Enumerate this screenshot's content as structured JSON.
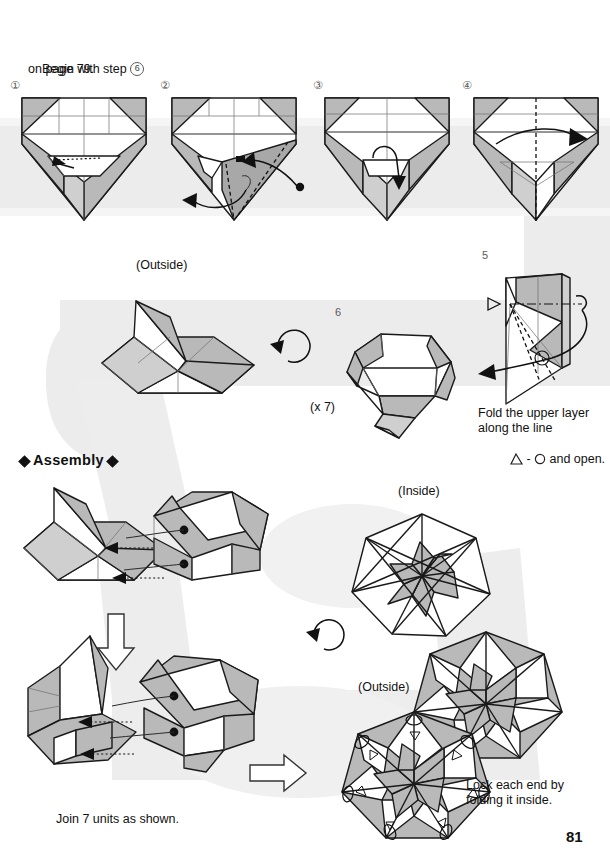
{
  "page": {
    "number": "81",
    "title_partial": "",
    "background_color": "#ffffff",
    "guide_band_color": "#ebebeb",
    "paper_gray": "#b9b9b9",
    "line_color": "#1a1a1a"
  },
  "intro": {
    "line1_pre": "Begin with step ",
    "line1_circled": "6",
    "line2": "on page 79."
  },
  "row1": {
    "steps": [
      {
        "num": "1",
        "num_display": "①"
      },
      {
        "num": "2",
        "num_display": "②"
      },
      {
        "num": "3",
        "num_display": "③"
      },
      {
        "num": "4",
        "num_display": "④"
      }
    ]
  },
  "row2": {
    "outside_label": "(Outside)",
    "step6_num": "6",
    "repeat_label": "(x 7)",
    "step5_num": "5",
    "step5_caption": {
      "line1": "Fold the upper layer",
      "line2": "along the line",
      "line3_pre": "",
      "line3_mid": " - ",
      "line3_post": " and open.",
      "symbol_left": "triangle-outline",
      "symbol_right": "circle-outline"
    }
  },
  "assembly": {
    "heading": "Assembly",
    "heading_ornament": "◆",
    "join_caption": "Join 7 units as shown.",
    "inside_label": "(Inside)",
    "outside_label": "(Outside)",
    "lock_caption": {
      "line1": "Lock each end by",
      "line2": "folding it inside."
    }
  },
  "icons": {
    "down_arrow": "down-block-arrow",
    "right_arrow": "right-block-arrow",
    "turn_over": "turn-over-rotation-arrow",
    "flip": "flip-rotation-arrow"
  }
}
